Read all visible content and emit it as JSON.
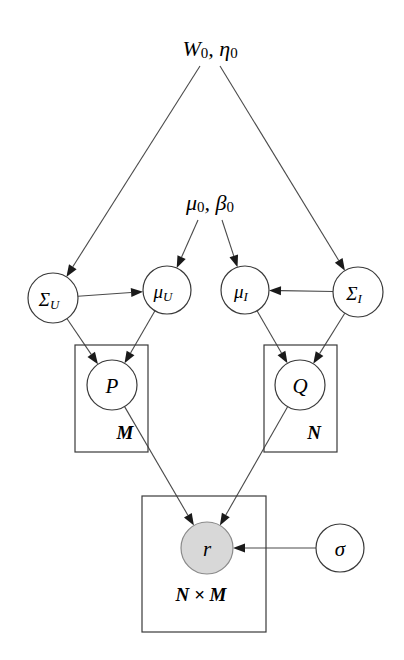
{
  "diagram": {
    "type": "probabilistic-graphical-model",
    "background_color": "#ffffff",
    "edge_color": "#4a4a4a",
    "node_stroke_color": "#3a3a3a",
    "observed_fill_color": "#d8d8d8",
    "latent_fill_color": "#ffffff"
  },
  "hyperparameters": [
    {
      "id": "W0_eta0",
      "base_left": "W",
      "sub_left": "0",
      "separator": ", ",
      "base_right": "η",
      "sub_right": "0",
      "plain": "W0, η0",
      "x": 210,
      "y": 48
    },
    {
      "id": "mu0_beta0",
      "base_left": "μ",
      "sub_left": "0",
      "separator": ", ",
      "base_right": "β",
      "sub_right": "0",
      "plain": "μ0, β0",
      "x": 210,
      "y": 202
    }
  ],
  "nodes": [
    {
      "id": "sigma_U",
      "base": "Σ",
      "sub": "U",
      "plain": "Σ_U",
      "cx": 53,
      "cy": 298,
      "r": 25,
      "observed": false
    },
    {
      "id": "mu_U",
      "base": "μ",
      "sub": "U",
      "plain": "μ_U",
      "cx": 167,
      "cy": 290,
      "r": 24,
      "observed": false
    },
    {
      "id": "mu_I",
      "base": "μ",
      "sub": "I",
      "plain": "μ_I",
      "cx": 245,
      "cy": 290,
      "r": 24,
      "observed": false
    },
    {
      "id": "sigma_I",
      "base": "Σ",
      "sub": "I",
      "plain": "Σ_I",
      "cx": 358,
      "cy": 292,
      "r": 25,
      "observed": false
    },
    {
      "id": "P",
      "base": "P",
      "sub": "",
      "plain": "P",
      "cx": 112,
      "cy": 385,
      "r": 25,
      "observed": false
    },
    {
      "id": "Q",
      "base": "Q",
      "sub": "",
      "plain": "Q",
      "cx": 300,
      "cy": 385,
      "r": 25,
      "observed": false
    },
    {
      "id": "r",
      "base": "r",
      "sub": "",
      "plain": "r",
      "cx": 207,
      "cy": 548,
      "r": 26,
      "observed": true
    },
    {
      "id": "sigma",
      "base": "σ",
      "sub": "",
      "plain": "σ",
      "cx": 340,
      "cy": 548,
      "r": 24,
      "observed": false
    }
  ],
  "plates": [
    {
      "id": "plate_M",
      "label": "M",
      "x": 75,
      "y": 345,
      "width": 73,
      "height": 107,
      "label_x": 125,
      "label_y": 432
    },
    {
      "id": "plate_N",
      "label": "N",
      "x": 264,
      "y": 345,
      "width": 73,
      "height": 107,
      "label_x": 314,
      "label_y": 432
    },
    {
      "id": "plate_NxM",
      "label": "N × M",
      "x": 142,
      "y": 496,
      "width": 124,
      "height": 136,
      "label_x": 201,
      "label_y": 594
    }
  ],
  "edges": [
    {
      "id": "W0-to-sigmaU",
      "from": "W0_eta0",
      "to": "sigma_U"
    },
    {
      "id": "W0-to-sigmaI",
      "from": "W0_eta0",
      "to": "sigma_I"
    },
    {
      "id": "mu0-to-muU",
      "from": "mu0_beta0",
      "to": "mu_U"
    },
    {
      "id": "mu0-to-muI",
      "from": "mu0_beta0",
      "to": "mu_I"
    },
    {
      "id": "sigmaU-to-muU",
      "from": "sigma_U",
      "to": "mu_U"
    },
    {
      "id": "sigmaI-to-muI",
      "from": "sigma_I",
      "to": "mu_I"
    },
    {
      "id": "sigmaU-to-P",
      "from": "sigma_U",
      "to": "P"
    },
    {
      "id": "muU-to-P",
      "from": "mu_U",
      "to": "P"
    },
    {
      "id": "muI-to-Q",
      "from": "mu_I",
      "to": "Q"
    },
    {
      "id": "sigmaI-to-Q",
      "from": "sigma_I",
      "to": "Q"
    },
    {
      "id": "P-to-r",
      "from": "P",
      "to": "r"
    },
    {
      "id": "Q-to-r",
      "from": "Q",
      "to": "r"
    },
    {
      "id": "sigma-to-r",
      "from": "sigma",
      "to": "r"
    }
  ]
}
